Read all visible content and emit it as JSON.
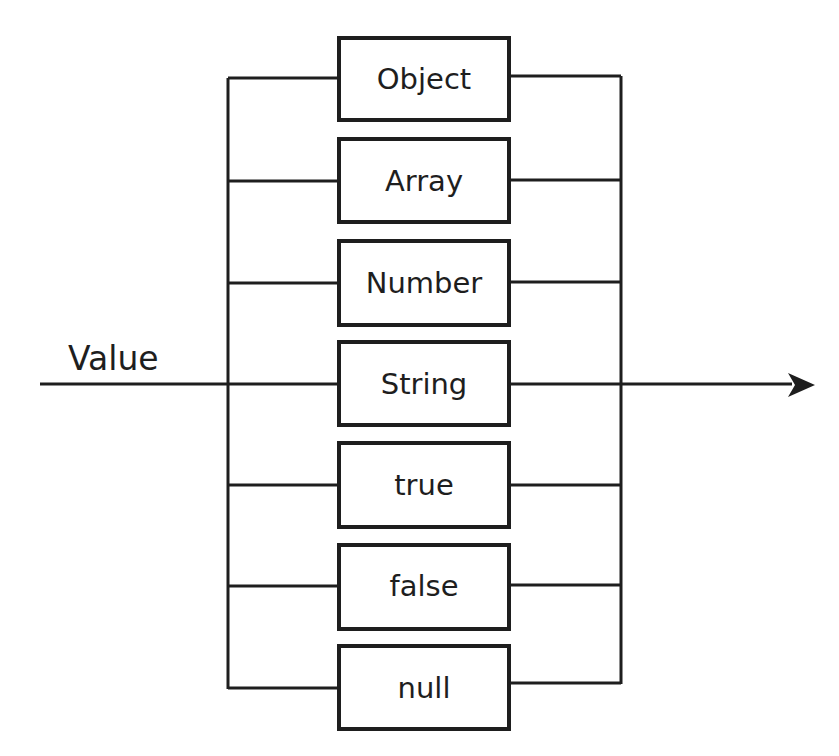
{
  "diagram": {
    "input_label": "Value",
    "stroke_color": "#1e1e1e",
    "background_color": "#ffffff",
    "boxes": [
      {
        "label": "Object",
        "top": 37
      },
      {
        "label": "Array",
        "top": 138
      },
      {
        "label": "Number",
        "top": 240
      },
      {
        "label": "String",
        "top": 341
      },
      {
        "label": "true",
        "top": 442
      },
      {
        "label": "false",
        "top": 544
      },
      {
        "label": "null",
        "top": 645
      }
    ],
    "output_arrow": "arrow-right"
  }
}
